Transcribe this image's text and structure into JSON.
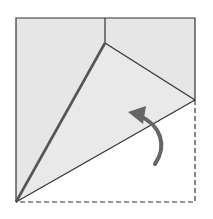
{
  "diagram": {
    "type": "origami-fold-step",
    "colors": {
      "paper": "#e8e8e8",
      "background": "#ffffff",
      "line": "#333333",
      "valley_crease": "#555555",
      "arrow": "#666666"
    },
    "elements": {
      "paper_square": "folded square paper",
      "fold_arrow": "curved arrow indicating fold up",
      "dashed_outline": "original paper position before fold"
    }
  }
}
